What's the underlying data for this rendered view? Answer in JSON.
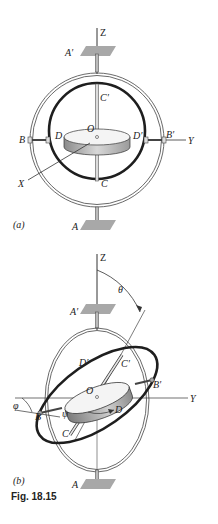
{
  "figure": {
    "caption": "Fig. 18.15",
    "panel_a": {
      "tag": "(a)",
      "labels": {
        "Z": "Z",
        "A_prime": "A′",
        "C_prime": "C′",
        "O": "O",
        "D": "D",
        "D_prime": "D′",
        "B": "B",
        "B_prime": "B′",
        "Y": "Y",
        "X": "X",
        "C": "C",
        "A": "A"
      }
    },
    "panel_b": {
      "tag": "(b)",
      "labels": {
        "Z": "Z",
        "theta": "θ",
        "A_prime": "A′",
        "D_prime": "D′",
        "C_prime": "C′",
        "B_prime": "B′",
        "O": "O",
        "Y": "Y",
        "phi": "φ",
        "B": "B",
        "psi": "ψ",
        "D": "D",
        "C": "C",
        "A": "A"
      }
    }
  }
}
